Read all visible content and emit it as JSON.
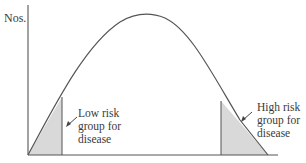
{
  "figure": {
    "y_axis_label": "Nos.",
    "curve": "bell-shaped normal distribution",
    "regions": [
      {
        "name": "low-risk",
        "lines": [
          "Low risk",
          "group for",
          "disease"
        ],
        "position": "left tail",
        "fill": "#d9d9d9"
      },
      {
        "name": "high-risk",
        "lines": [
          "High risk",
          "group for",
          "disease"
        ],
        "position": "right tail",
        "fill": "#d9d9d9"
      }
    ],
    "colors": {
      "line": "#555555",
      "shade": "#d9d9d9",
      "text": "#3a3a3a",
      "background": "#ffffff"
    }
  }
}
